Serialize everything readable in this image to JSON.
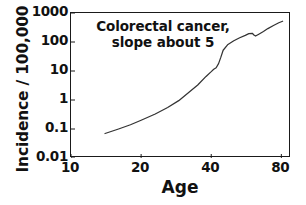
{
  "chart_data": {
    "type": "line",
    "title": "",
    "annotation": {
      "line1": "Colorectal cancer,",
      "line2": "slope about 5"
    },
    "xlabel": "Age",
    "ylabel": "Incidence / 100,000",
    "xscale": "log",
    "yscale": "log",
    "xlim": [
      10,
      88
    ],
    "ylim": [
      0.01,
      1000
    ],
    "xticks": [
      10,
      20,
      40,
      80
    ],
    "xtick_labels": [
      "10",
      "20",
      "40",
      "80"
    ],
    "yticks": [
      0.01,
      0.1,
      1,
      10,
      100,
      1000
    ],
    "ytick_labels": [
      "0.01",
      "0.1",
      "1",
      "10",
      "100",
      "1000"
    ],
    "grid": false,
    "legend": "none",
    "series": [
      {
        "name": "Colorectal cancer incidence",
        "x": [
          14,
          16,
          18,
          20,
          23,
          26,
          29,
          32,
          35,
          38,
          40,
          41,
          42,
          43,
          44,
          45,
          47,
          50,
          53,
          56,
          58,
          60,
          61,
          62,
          64,
          67,
          70,
          74,
          78,
          81
        ],
        "y": [
          0.07,
          0.1,
          0.14,
          0.2,
          0.33,
          0.55,
          0.95,
          1.8,
          3.3,
          6.5,
          9.5,
          11.5,
          13,
          18,
          30,
          52,
          80,
          110,
          140,
          170,
          195,
          200,
          175,
          160,
          185,
          230,
          290,
          370,
          460,
          520
        ]
      }
    ]
  },
  "colors": {
    "axis": "#1a1a1a",
    "line": "#333333",
    "background": "#ffffff",
    "text": "#111111"
  }
}
